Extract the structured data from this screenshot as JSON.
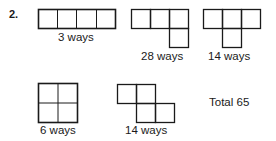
{
  "problem_number": "2.",
  "shapes": [
    {
      "name": "straight-tetromino",
      "label": "3 ways"
    },
    {
      "name": "l-tetromino",
      "label": "28 ways"
    },
    {
      "name": "t-tetromino",
      "label": "14 ways"
    },
    {
      "name": "square-tetromino",
      "label": "6 ways"
    },
    {
      "name": "s-tetromino",
      "label": "14 ways"
    }
  ],
  "total": "Total 65"
}
